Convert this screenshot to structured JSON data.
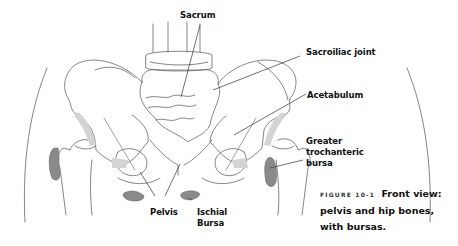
{
  "figure": {
    "labels": {
      "sacrum": "Sacrum",
      "sacroiliac_joint": "Sacroiliac joint",
      "acetabulum": "Acetabulum",
      "greater_trochanteric_bursa": [
        "Greater",
        "trochanteric",
        "bursa"
      ],
      "pelvis": "Pelvis",
      "ischial_bursa": [
        "Ischial",
        "Bursa"
      ]
    },
    "caption": {
      "figure_number": "FIGURE 10-1",
      "line1": "Front view:",
      "line2": "pelvis and hip bones,",
      "line3": "with bursas."
    },
    "colors": {
      "bursa_fill": "#8a8a8a",
      "cartilage_fill": "#d4d4d4",
      "outline": "#555555",
      "leader_line": "#333333"
    }
  }
}
